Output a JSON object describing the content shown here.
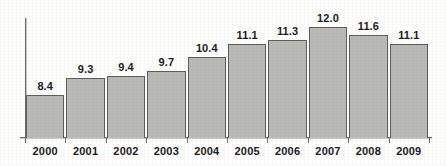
{
  "chart_data": {
    "type": "bar",
    "title": "",
    "subtitle": "",
    "xlabel": "",
    "ylabel": "",
    "categories": [
      "2000",
      "2001",
      "2002",
      "2003",
      "2004",
      "2005",
      "2006",
      "2007",
      "2008",
      "2009"
    ],
    "values": [
      8.4,
      9.3,
      9.4,
      9.7,
      10.4,
      11.1,
      11.3,
      12.0,
      11.6,
      11.1
    ],
    "data_labels": [
      "8.4",
      "9.3",
      "9.4",
      "9.7",
      "10.4",
      "11.1",
      "11.3",
      "12.0",
      "11.6",
      "11.1"
    ],
    "ylim": [
      6.2,
      12.6
    ],
    "grid": false,
    "legend": null,
    "axis_visible": {
      "x": true,
      "y": true
    },
    "tick_labels_y": [],
    "annotations": [],
    "colors": {
      "bar_fill": "#b9b9b6",
      "bar_border": "#5d5d5d",
      "axis": "#6e6e6e",
      "text": "#1c1c1c",
      "background": "#fdfdfc"
    }
  }
}
